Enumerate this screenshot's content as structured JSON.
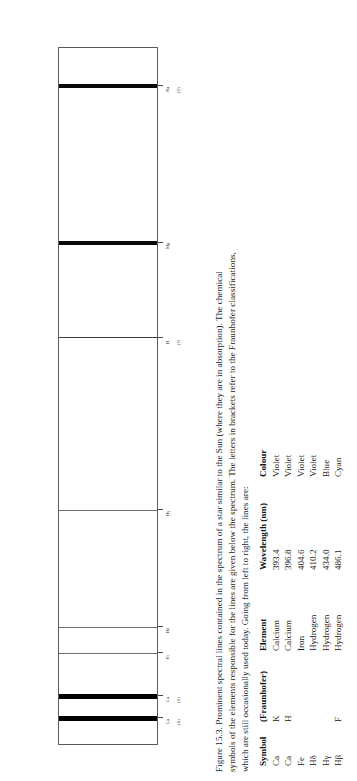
{
  "figure": {
    "number": "Figure 15.3.",
    "caption_lines": [
      "Figure 15.3.   Prominent spectral lines contained in the spectrum of a star similar to the Sun (where they are in absorption). The chemical",
      "symbols of the elements responsible for the lines are given below the spectrum. The letters in brackets refer to the Fraunhofer classifications,",
      "which are still occasionally used today. Going from left to right, the lines are:"
    ]
  },
  "spectrum": {
    "axis_note": "wavelength increases from left to right (panel drawn rotated 90 degrees)",
    "lines": [
      {
        "element_label": "Ca",
        "fraunhofer_label": "(K)",
        "wavelength_nm": 393.4,
        "position_pct": 4.0,
        "thickness_px": 5,
        "darkness": "very-strong"
      },
      {
        "element_label": "Ca",
        "fraunhofer_label": "(H)",
        "wavelength_nm": 396.8,
        "position_pct": 7.1,
        "thickness_px": 5,
        "darkness": "very-strong"
      },
      {
        "element_label": "Fe",
        "fraunhofer_label": "",
        "wavelength_nm": 404.6,
        "position_pct": 13.3,
        "thickness_px": 1,
        "darkness": "weak"
      },
      {
        "element_label": "Hδ",
        "fraunhofer_label": "",
        "wavelength_nm": 410.2,
        "position_pct": 17.0,
        "thickness_px": 1,
        "darkness": "weak"
      },
      {
        "element_label": "Hγ",
        "fraunhofer_label": "",
        "wavelength_nm": 434.0,
        "position_pct": 33.8,
        "thickness_px": 1,
        "darkness": "weak"
      },
      {
        "element_label": "H",
        "fraunhofer_label": "(F)",
        "wavelength_nm": 486.1,
        "position_pct": 58.5,
        "thickness_px": 1.5,
        "darkness": "medium"
      },
      {
        "element_label": "Mg",
        "fraunhofer_label": "",
        "wavelength_nm": 518.4,
        "position_pct": 72.0,
        "thickness_px": 4,
        "darkness": "strong"
      },
      {
        "element_label": "Na",
        "fraunhofer_label": "(D)",
        "wavelength_nm": 589.0,
        "position_pct": 94.5,
        "thickness_px": 4,
        "darkness": "strong"
      },
      {
        "element_label": "Hβ",
        "fraunhofer_label": "(C)",
        "wavelength_nm": 656.3,
        "position_pct": 119.0,
        "thickness_px": 4,
        "darkness": "strong"
      }
    ]
  },
  "table": {
    "headers": [
      "Symbol",
      "(Fraunhofer)",
      "Element",
      "Wavelength (nm)",
      "Colour"
    ],
    "rows": [
      {
        "symbol": "Ca",
        "fraunhofer": "K",
        "element": "Calcium",
        "wavelength": "393.4",
        "colour": "Violet"
      },
      {
        "symbol": "Ca",
        "fraunhofer": "H",
        "element": "Calcium",
        "wavelength": "396.8",
        "colour": "Violet"
      },
      {
        "symbol": "Fe",
        "fraunhofer": "",
        "element": "Iron",
        "wavelength": "404.6",
        "colour": "Violet"
      },
      {
        "symbol": "Hδ",
        "fraunhofer": "",
        "element": "Hydrogen",
        "wavelength": "410.2",
        "colour": "Violet"
      },
      {
        "symbol": "Hγ",
        "fraunhofer": "",
        "element": "Hydrogen",
        "wavelength": "434.0",
        "colour": "Blue"
      },
      {
        "symbol": "Hβ",
        "fraunhofer": "F",
        "element": "Hydrogen",
        "wavelength": "486.1",
        "colour": "Cyan"
      }
    ]
  }
}
